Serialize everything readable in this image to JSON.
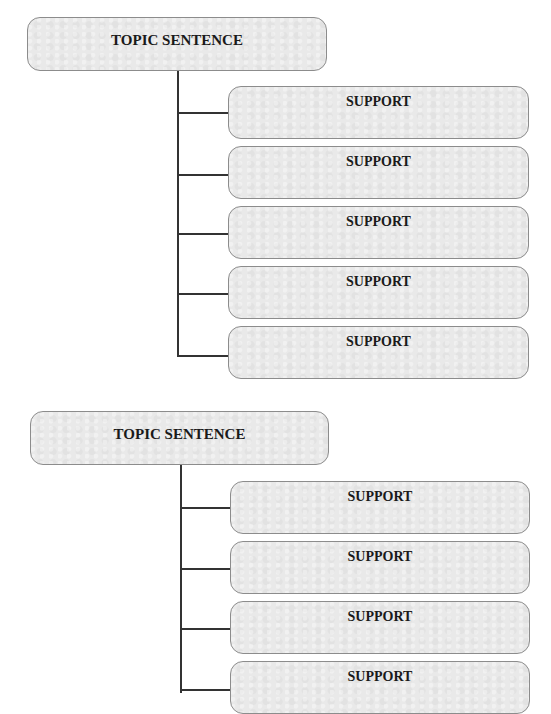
{
  "diagram": {
    "groups": [
      {
        "topic": "TOPIC SENTENCE",
        "supports": [
          "SUPPORT",
          "SUPPORT",
          "SUPPORT",
          "SUPPORT",
          "SUPPORT"
        ]
      },
      {
        "topic": "TOPIC SENTENCE",
        "supports": [
          "SUPPORT",
          "SUPPORT",
          "SUPPORT",
          "SUPPORT"
        ]
      }
    ]
  },
  "colors": {
    "box_fill": "#e9e9e9",
    "box_border": "#8c8c8c",
    "line": "#333333",
    "text": "#1a1a1a"
  }
}
